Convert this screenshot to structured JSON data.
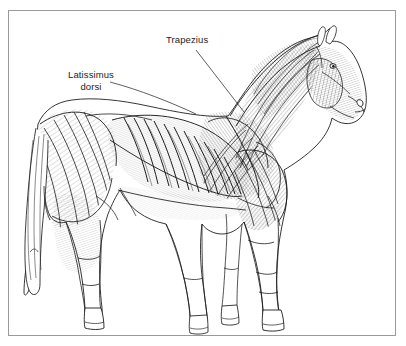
{
  "figure": {
    "kind": "anatomical-illustration",
    "style": "pen-and-ink line drawing with cross-hatching",
    "background_color": "#ffffff",
    "frame_color": "#9a9a9a",
    "ink_color": "#1c1c1c"
  },
  "labels": {
    "trapezius": {
      "text": "Trapezius"
    },
    "latissimus": {
      "line1": "Latissimus",
      "line2": "dorsi"
    }
  },
  "icons": {
    "leader_line": "leader-line-icon"
  }
}
